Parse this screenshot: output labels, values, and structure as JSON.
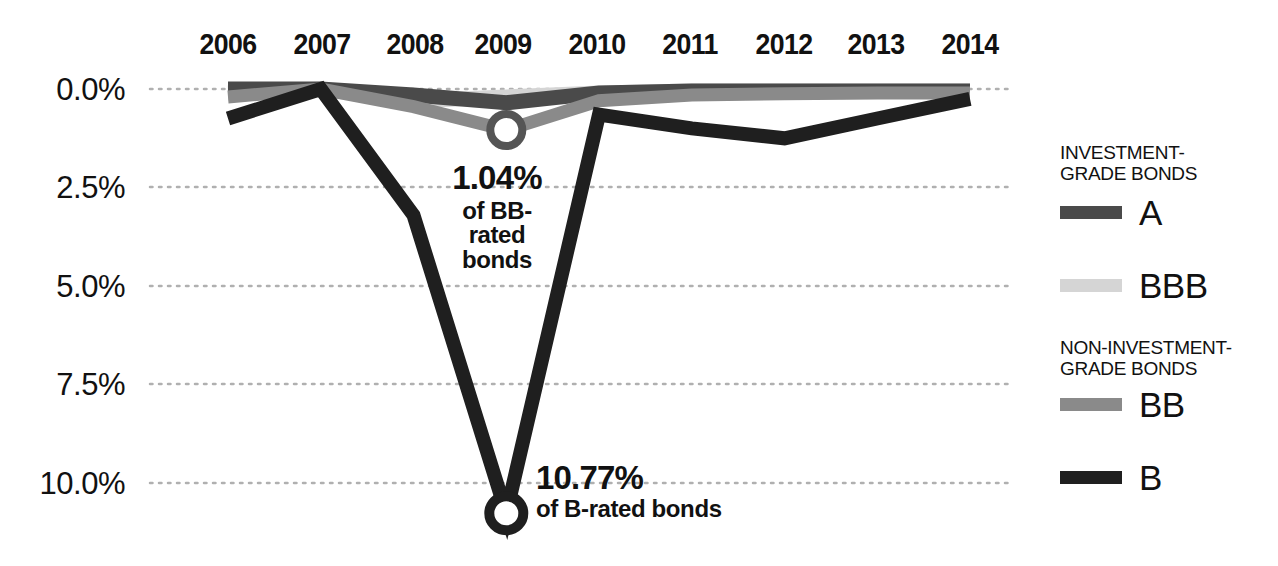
{
  "chart_data": {
    "type": "line",
    "title": "",
    "subtitle": "",
    "xlabel": "",
    "ylabel": "",
    "x": [
      2006,
      2007,
      2008,
      2009,
      2010,
      2011,
      2012,
      2013,
      2014
    ],
    "x_tick_labels": [
      "2006",
      "2007",
      "2008",
      "2009",
      "2010",
      "2011",
      "2012",
      "2013",
      "2014"
    ],
    "y_tick_labels": [
      "0.0%",
      "2.5%",
      "5.0%",
      "7.5%",
      "10.0%"
    ],
    "y_tick_values": [
      0.0,
      2.5,
      5.0,
      7.5,
      10.0
    ],
    "ylim": [
      0.0,
      10.4
    ],
    "y_axis_inverted": true,
    "grid": "horizontal-dotted",
    "legend_position": "right",
    "series": [
      {
        "name": "A",
        "group": "Investment-grade bonds",
        "color": "#4a4a4a",
        "values": [
          0.0,
          0.0,
          0.15,
          0.35,
          0.1,
          0.05,
          0.05,
          0.05,
          0.05
        ]
      },
      {
        "name": "BBB",
        "group": "Investment-grade bonds",
        "color": "#d5d5d5",
        "values": [
          0.1,
          0.0,
          0.3,
          0.2,
          0.1,
          0.05,
          0.05,
          0.05,
          0.05
        ]
      },
      {
        "name": "BB",
        "group": "Non-investment-grade bonds",
        "color": "#8a8a8a",
        "values": [
          0.2,
          0.0,
          0.45,
          1.04,
          0.3,
          0.15,
          0.12,
          0.1,
          0.1
        ]
      },
      {
        "name": "B",
        "group": "Non-investment-grade bonds",
        "color": "#1f1f1f",
        "values": [
          0.75,
          0.0,
          3.2,
          10.77,
          0.65,
          1.0,
          1.25,
          0.75,
          0.25
        ]
      }
    ],
    "markers": [
      {
        "series": "BB",
        "x": 2009,
        "y": 1.04,
        "style": "ring"
      },
      {
        "series": "B",
        "x": 2009,
        "y": 10.77,
        "style": "ring"
      }
    ],
    "annotations": [
      {
        "id": "bb-callout",
        "value": "1.04%",
        "description": "of BB-\nrated\nbonds",
        "points_to_series": "BB",
        "points_to_x": 2009
      },
      {
        "id": "b-callout",
        "value": "10.77%",
        "description": "of B-rated bonds",
        "points_to_series": "B",
        "points_to_x": 2009
      }
    ]
  },
  "legend": {
    "groups": [
      {
        "header": "INVESTMENT-\nGRADE BONDS",
        "entries": [
          {
            "label": "A",
            "color": "#4a4a4a"
          },
          {
            "label": "BBB",
            "color": "#d5d5d5"
          }
        ]
      },
      {
        "header": "NON-INVESTMENT-\nGRADE BONDS",
        "entries": [
          {
            "label": "BB",
            "color": "#8a8a8a"
          },
          {
            "label": "B",
            "color": "#1f1f1f"
          }
        ]
      }
    ]
  },
  "annotations": {
    "bb": {
      "value": "1.04%",
      "line1": "of BB-",
      "line2": "rated",
      "line3": "bonds"
    },
    "b": {
      "value": "10.77%",
      "line1": "of B-rated bonds"
    }
  },
  "axes": {
    "y_ticks": [
      "0.0%",
      "2.5%",
      "5.0%",
      "7.5%",
      "10.0%"
    ],
    "x_ticks": [
      "2006",
      "2007",
      "2008",
      "2009",
      "2010",
      "2011",
      "2012",
      "2013",
      "2014"
    ]
  },
  "colors": {
    "a": "#4a4a4a",
    "bbb": "#d5d5d5",
    "bb": "#8a8a8a",
    "b": "#1f1f1f",
    "grid": "#b8b8b8",
    "text": "#111111",
    "background": "#ffffff"
  }
}
